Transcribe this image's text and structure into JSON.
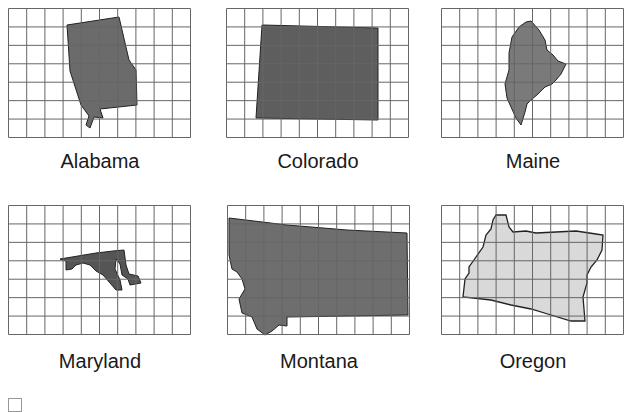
{
  "panels": [
    {
      "name": "Alabama",
      "fill": "#6b6b6b"
    },
    {
      "name": "Colorado",
      "fill": "#5e5e5e"
    },
    {
      "name": "Maine",
      "fill": "#7a7a7a"
    },
    {
      "name": "Maryland",
      "fill": "#555555"
    },
    {
      "name": "Montana",
      "fill": "#6e6e6e"
    },
    {
      "name": "Oregon",
      "fill": "#d9d9d9"
    }
  ],
  "grid": {
    "columns": 10,
    "rows": 7,
    "line_color": "#666666"
  },
  "footer": {
    "faint_text_1": "",
    "faint_text_2": ""
  }
}
